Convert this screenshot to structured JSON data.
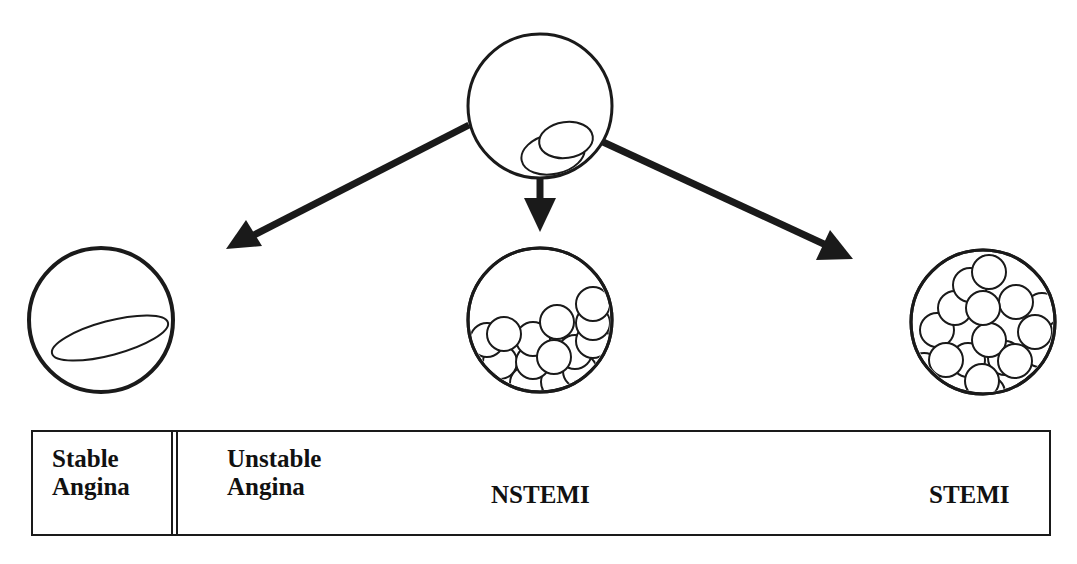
{
  "diagram": {
    "type": "progression-diagram",
    "stroke_color": "#1a1a1a",
    "background": "#ffffff",
    "nodes": {
      "source": {
        "description": "vessel cross-section with small plaque/thrombus",
        "icon": "vessel-plaque-icon"
      },
      "stable": {
        "description": "vessel with elongated plaque (no thrombus)",
        "icon": "vessel-stable-plaque-icon"
      },
      "partial": {
        "description": "vessel partially occluded by thrombus cells",
        "icon": "vessel-partial-occlusion-icon"
      },
      "total": {
        "description": "vessel fully occluded by thrombus cells",
        "icon": "vessel-total-occlusion-icon"
      }
    },
    "arrows": [
      {
        "from": "source",
        "to": "left",
        "direction": "down-left"
      },
      {
        "from": "source",
        "to": "partial",
        "direction": "down"
      },
      {
        "from": "source",
        "to": "total",
        "direction": "down-right"
      }
    ]
  },
  "spectrum": {
    "labels": {
      "stable_line1": "Stable",
      "stable_line2": "Angina",
      "unstable_line1": "Unstable",
      "unstable_line2": "Angina",
      "nstemi": "NSTEMI",
      "stemi": "STEMI"
    }
  }
}
